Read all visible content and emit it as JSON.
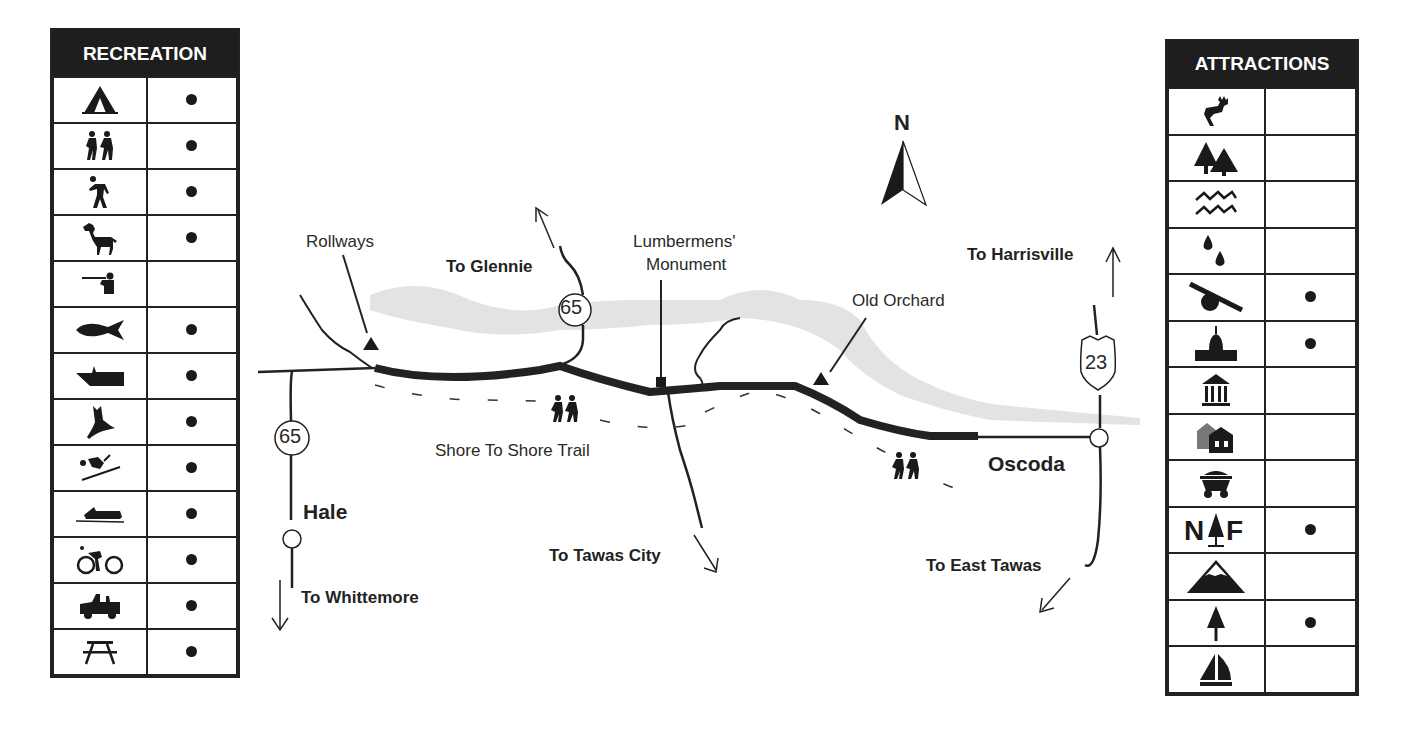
{
  "recreation": {
    "title": "RECREATION",
    "rows": [
      {
        "icon": "camping-tent-icon",
        "available": true
      },
      {
        "icon": "group-hiking-icon",
        "available": true
      },
      {
        "icon": "hiking-icon",
        "available": true
      },
      {
        "icon": "horseback-riding-icon",
        "available": true
      },
      {
        "icon": "hunting-icon",
        "available": false
      },
      {
        "icon": "fishing-icon",
        "available": true
      },
      {
        "icon": "boating-icon",
        "available": true
      },
      {
        "icon": "wildlife-viewing-bird-icon",
        "available": true
      },
      {
        "icon": "skiing-icon",
        "available": true
      },
      {
        "icon": "snowmobiling-icon",
        "available": true
      },
      {
        "icon": "bicycling-icon",
        "available": true
      },
      {
        "icon": "off-road-vehicle-icon",
        "available": true
      },
      {
        "icon": "picnic-table-icon",
        "available": true
      }
    ]
  },
  "attractions": {
    "title": "ATTRACTIONS",
    "rows": [
      {
        "icon": "deer-wildlife-icon",
        "available": false
      },
      {
        "icon": "forest-trees-icon",
        "available": false
      },
      {
        "icon": "water-waves-icon",
        "available": false
      },
      {
        "icon": "springs-drops-icon",
        "available": false
      },
      {
        "icon": "cannon-historic-site-icon",
        "available": true
      },
      {
        "icon": "capitol-monument-icon",
        "available": true
      },
      {
        "icon": "museum-icon",
        "available": false
      },
      {
        "icon": "historic-buildings-icon",
        "available": false
      },
      {
        "icon": "mine-cart-icon",
        "available": false
      },
      {
        "icon": "national-forest-icon",
        "available": true
      },
      {
        "icon": "mountain-icon",
        "available": false
      },
      {
        "icon": "tree-icon",
        "available": true
      },
      {
        "icon": "sailboat-icon",
        "available": false
      }
    ]
  },
  "map": {
    "north_label": "N",
    "labels": {
      "rollways": "Rollways",
      "to_glennie": "To Glennie",
      "lumbermens_1": "Lumbermens'",
      "lumbermens_2": "Monument",
      "old_orchard": "Old Orchard",
      "to_harrisville": "To Harrisville",
      "shore_trail": "Shore To Shore Trail",
      "hale": "Hale",
      "to_whittemore": "To Whittemore",
      "to_tawas_city": "To Tawas City",
      "oscoda": "Oscoda",
      "to_east_tawas": "To East Tawas"
    },
    "shields": {
      "m65_north": "65",
      "m65_south": "65",
      "us23": "23"
    }
  }
}
